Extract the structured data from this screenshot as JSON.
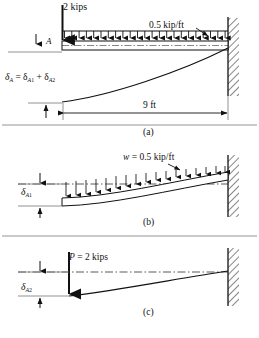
{
  "figure": {
    "ink_color": "#111111",
    "background": "#ffffff",
    "panels": [
      {
        "id": "a",
        "label": "(a)",
        "labels": {
          "point_load": "2 kips",
          "distributed_load": "0.5 kip/ft",
          "point_A": "A",
          "deflection_equation": "δ",
          "deflection_eq_sub1": "A",
          "deflection_eq_mid": " = δ",
          "deflection_eq_sub2": "A",
          "deflection_eq_sub2n": "1",
          "deflection_eq_plus": " + δ",
          "deflection_eq_sub3": "A",
          "deflection_eq_sub3n": "2",
          "span_dimension": "9 ft"
        }
      },
      {
        "id": "b",
        "label": "(b)",
        "labels": {
          "distributed_load_sym": "w",
          "distributed_load_eq": " = 0.5 kip/ft",
          "deflection_sym": "δ",
          "deflection_sub": "A",
          "deflection_subn": "1"
        }
      },
      {
        "id": "c",
        "label": "(c)",
        "labels": {
          "point_load_sym": "P",
          "point_load_eq": " = 2 kips",
          "deflection_sym": "δ",
          "deflection_sub": "A",
          "deflection_subn": "2"
        }
      }
    ]
  }
}
